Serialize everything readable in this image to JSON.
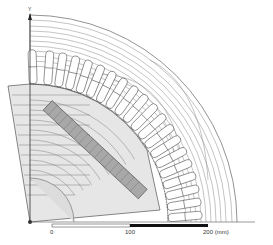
{
  "figure": {
    "axis_label_y": "Y",
    "scale_bar": {
      "ticks": [
        "0",
        "100",
        "200 (mm)"
      ],
      "unit": "mm"
    },
    "colors": {
      "lines": "#555555",
      "rotor_fill": "#d9d9d9",
      "magnet_fill": "#9a9a9a",
      "scale_dark": "#111111",
      "background": "#ffffff"
    },
    "stator_slot_count_visible": 20
  }
}
